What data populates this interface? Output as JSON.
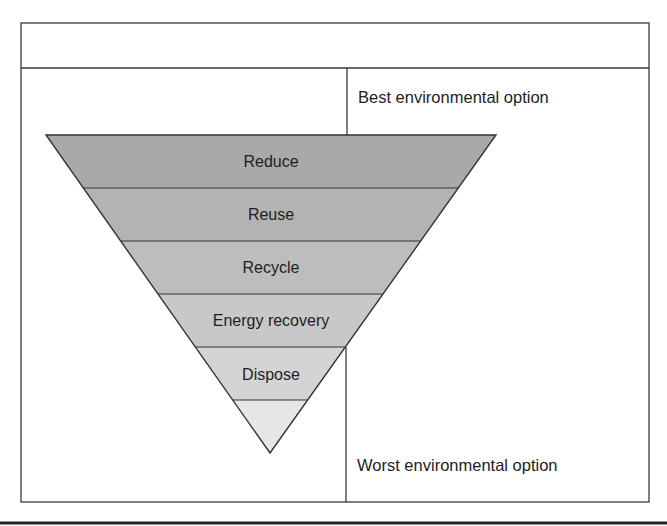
{
  "diagram": {
    "type": "inverted-pyramid",
    "top_label": "Best environmental option",
    "bottom_label": "Worst environmental option",
    "tiers": [
      {
        "label": "Reduce",
        "fill": "#a9a9a9"
      },
      {
        "label": "Reuse",
        "fill": "#b3b3b3"
      },
      {
        "label": "Recycle",
        "fill": "#bdbdbd"
      },
      {
        "label": "Energy recovery",
        "fill": "#c8c8c8"
      },
      {
        "label": "Dispose",
        "fill": "#d4d4d4"
      },
      {
        "label": "",
        "fill": "#e6e6e6"
      }
    ],
    "colors": {
      "line": "#333333",
      "text": "#1e1e1e",
      "background": "#ffffff"
    }
  }
}
